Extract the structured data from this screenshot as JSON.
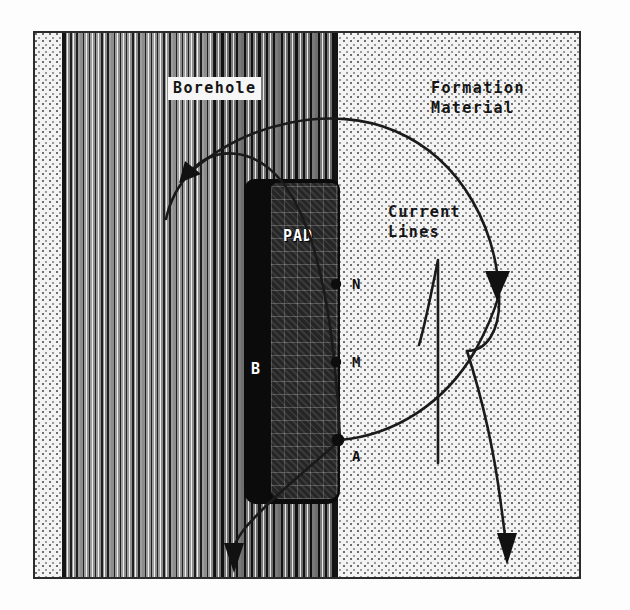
{
  "figure": {
    "title_labels": {
      "borehole": "Borehole",
      "formation_line1": "Formation",
      "formation_line2": "Material",
      "current_line1": "Current",
      "current_line2": "Lines"
    },
    "pad": {
      "label": "PAD",
      "back_label": "B"
    },
    "electrodes": [
      {
        "id": "N",
        "label": "N"
      },
      {
        "id": "M",
        "label": "M"
      },
      {
        "id": "A",
        "label": "A"
      }
    ],
    "colors": {
      "frame_border": "#2b2b2b",
      "formation_fill": "#f3f3f3",
      "formation_stipple": "#6e6e6e",
      "borehole_stripe_dark": "#1f1f1f",
      "borehole_stripe_light": "#efefef",
      "pad_body": "#0b0b0b",
      "pad_face": "#2a2a2a",
      "current_line": "#1a1a1a",
      "wall_line": "#141414",
      "label_text": "#151515",
      "pad_text": "#ffffff"
    },
    "geometry": {
      "frame": {
        "x": 33,
        "y": 31,
        "width": 548,
        "height": 548
      },
      "borehole_band": {
        "left": 62,
        "width": 272
      },
      "wall_line_x": 60,
      "formation_boundary_x": 334,
      "pad": {
        "left": 244,
        "top": 178,
        "width": 98,
        "height": 325
      }
    },
    "current_line_arrows": 4
  }
}
